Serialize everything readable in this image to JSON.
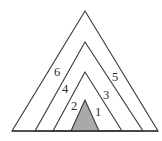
{
  "figure": {
    "canvas": {
      "width": 162,
      "height": 141
    },
    "background_color": "#ffffff",
    "stroke_color": "#3a3a3a",
    "shaded_fill_color": "#a9a9a9",
    "base_line": {
      "x1": 12,
      "y1": 131,
      "x2": 158,
      "y2": 131
    },
    "triangles": [
      {
        "name": "outermost-triangle",
        "apex": {
          "x": 85,
          "y": 11
        },
        "base_left": {
          "x": 12,
          "y": 131
        },
        "base_right": {
          "x": 158,
          "y": 131
        },
        "filled": false,
        "points": "85,11 12,131 158,131"
      },
      {
        "name": "second-triangle",
        "apex": {
          "x": 85,
          "y": 42
        },
        "base_left": {
          "x": 35,
          "y": 131
        },
        "base_right": {
          "x": 143,
          "y": 131
        },
        "filled": false,
        "points": "85,42 35,131 143,131"
      },
      {
        "name": "third-triangle",
        "apex": {
          "x": 85,
          "y": 72
        },
        "base_left": {
          "x": 53,
          "y": 131
        },
        "base_right": {
          "x": 122,
          "y": 131
        },
        "filled": false,
        "points": "85,72 53,131 122,131"
      },
      {
        "name": "innermost-shaded-triangle",
        "apex": {
          "x": 85,
          "y": 100
        },
        "base_left": {
          "x": 71,
          "y": 131
        },
        "base_right": {
          "x": 99,
          "y": 131
        },
        "filled": true,
        "points": "85,100 71,131 99,131"
      }
    ],
    "labels": [
      {
        "text": "6",
        "x": 57,
        "y": 73,
        "side": "left"
      },
      {
        "text": "4",
        "x": 65,
        "y": 90,
        "side": "left"
      },
      {
        "text": "2",
        "x": 74,
        "y": 107,
        "side": "left"
      },
      {
        "text": "5",
        "x": 115,
        "y": 78,
        "side": "right"
      },
      {
        "text": "3",
        "x": 106,
        "y": 96,
        "side": "right"
      },
      {
        "text": "1",
        "x": 98,
        "y": 113,
        "side": "right"
      }
    ]
  }
}
